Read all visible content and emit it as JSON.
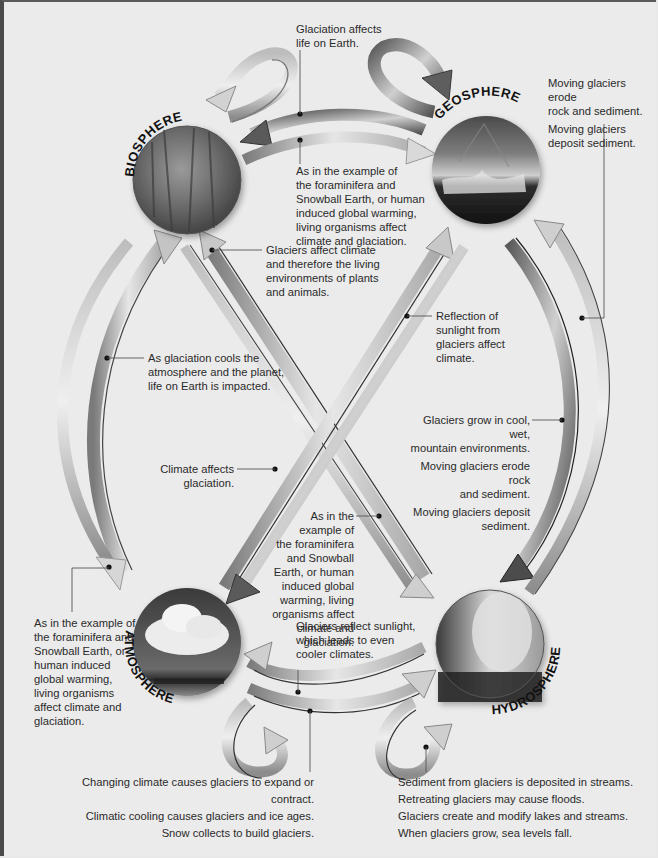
{
  "spheres": {
    "biosphere": {
      "label": "BIOSPHERE",
      "image": "forest-photo"
    },
    "geosphere": {
      "label": "GEOSPHERE",
      "image": "mountain-photo"
    },
    "atmosphere": {
      "label": "ATMOSPHERE",
      "image": "cumulus-cloud-photo"
    },
    "hydrosphere": {
      "label": "HYDROSPHERE",
      "image": "geyser-steam-photo"
    }
  },
  "annotations": {
    "geo_to_bio": {
      "lines": [
        "Glaciation affects",
        "life on Earth."
      ]
    },
    "bio_to_geo": {
      "lines": [
        "As in the example of",
        "the foraminifera and",
        "Snowball Earth, or human",
        "induced global warming,",
        "living organisms affect",
        "climate and glaciation."
      ]
    },
    "geo_self": {
      "paragraphs": [
        [
          "Moving glaciers erode",
          "rock and sediment."
        ],
        [
          "Moving glaciers",
          "deposit sediment."
        ]
      ]
    },
    "hydro_to_bio": {
      "lines": [
        "Glaciers affect climate",
        "and therefore the living",
        "environments of plants",
        "and animals."
      ]
    },
    "atmo_to_geo": {
      "lines": [
        "Reflection of",
        "sunlight from",
        "glaciers affect",
        "climate."
      ]
    },
    "atmo_to_bio": {
      "lines": [
        "As glaciation cools the",
        "atmosphere and the planet,",
        "life on Earth is impacted."
      ]
    },
    "geo_to_hydro": {
      "paragraphs": [
        [
          "Glaciers grow in cool, wet,",
          "mountain environments."
        ],
        [
          "Moving glaciers erode rock",
          "and sediment."
        ],
        [
          "Moving glaciers deposit",
          "sediment."
        ]
      ]
    },
    "geo_to_atmo": {
      "lines": [
        "Climate affects",
        "glaciation."
      ]
    },
    "bio_to_hydro": {
      "lines": [
        "As in the",
        "example of",
        "the foraminifera",
        "and Snowball",
        "Earth, or human",
        "induced global",
        "warming, living",
        "organisms affect",
        "climate and glaciation."
      ]
    },
    "bio_to_atmo": {
      "lines": [
        "As in the example of",
        "the foraminifera and",
        "Snowball Earth, or",
        "human induced",
        "global warming,",
        "living organisms",
        "affect climate and",
        "glaciation."
      ]
    },
    "hydro_to_atmo": {
      "lines": [
        "Glaciers reflect sunlight,",
        "which leads to even",
        "cooler climates."
      ]
    },
    "atmo_self": {
      "lines": [
        "Changing climate causes glaciers to expand or contract.",
        "Climatic cooling causes glaciers and ice ages.",
        "Snow collects to build glaciers."
      ]
    },
    "hydro_self": {
      "lines": [
        "Sediment from glaciers is deposited in streams.",
        "Retreating glaciers may cause floods.",
        "Glaciers create and modify lakes and streams.",
        "When glaciers grow, sea levels fall."
      ]
    }
  },
  "colors": {
    "background": "#ebebeb",
    "text": "#2a2a2a",
    "arrow_light": "#d4d4d4",
    "arrow_dark": "#6a6a6a",
    "border": "#4a4a4a"
  }
}
